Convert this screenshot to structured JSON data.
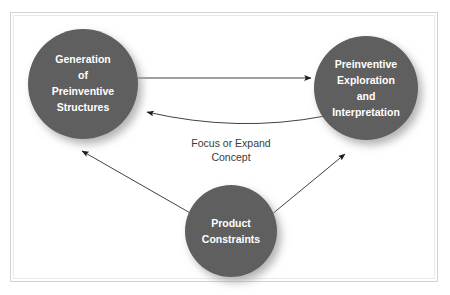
{
  "diagram": {
    "background_color": "#ffffff",
    "frame_color": "#d2d2d2",
    "node_fill_color": "#5e5e5e",
    "node_text_color": "#ffffff",
    "edge_color": "#2b2b2b",
    "edge_label_color": "#3a3a3a",
    "nodes": [
      {
        "id": "generation",
        "name": "generation-of-preinventive-structures",
        "lines": [
          "Generation",
          "of",
          "Preinventive",
          "Structures"
        ],
        "cx": 83,
        "cy": 84,
        "r": 55
      },
      {
        "id": "exploration",
        "name": "preinventive-exploration-and-interpretation",
        "lines": [
          "Preinventive",
          "Exploration",
          "and",
          "Interpretation"
        ],
        "cx": 366,
        "cy": 88,
        "r": 52
      },
      {
        "id": "constraints",
        "name": "product-constraints",
        "lines": [
          "Product",
          "Constraints"
        ],
        "cx": 231,
        "cy": 231,
        "r": 46
      }
    ],
    "edges": [
      {
        "id": "gen-to-exp",
        "name": "arrow-generation-to-exploration",
        "from": "generation",
        "to": "exploration",
        "style": "straight",
        "label": ""
      },
      {
        "id": "exp-to-gen",
        "name": "arrow-exploration-to-generation",
        "from": "exploration",
        "to": "generation",
        "style": "curved",
        "label": "Focus or Expand Concept"
      },
      {
        "id": "con-to-gen",
        "name": "arrow-constraints-to-generation",
        "from": "constraints",
        "to": "generation",
        "style": "straight",
        "label": ""
      },
      {
        "id": "con-to-exp",
        "name": "arrow-constraints-to-exploration",
        "from": "constraints",
        "to": "exploration",
        "style": "straight",
        "label": ""
      }
    ],
    "edge_labels": [
      {
        "id": "focus-expand",
        "name": "edge-label-focus-or-expand-concept",
        "lines": [
          "Focus or Expand",
          "Concept"
        ],
        "x": 231,
        "y": 144
      }
    ]
  }
}
